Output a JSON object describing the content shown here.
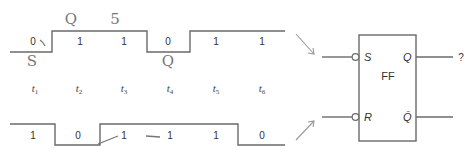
{
  "diagram": {
    "time_labels": [
      {
        "base": "t",
        "sub": "1"
      },
      {
        "base": "t",
        "sub": "2"
      },
      {
        "base": "t",
        "sub": "3"
      },
      {
        "base": "t",
        "sub": "4"
      },
      {
        "base": "t",
        "sub": "5"
      },
      {
        "base": "t",
        "sub": "6"
      }
    ],
    "s_waveform": {
      "name": "S input",
      "values": [
        "0",
        "1",
        "1",
        "0",
        "1",
        "1"
      ]
    },
    "r_waveform": {
      "name": "R input",
      "values": [
        "1",
        "0",
        "1",
        "1",
        "1",
        "0"
      ]
    },
    "handwritten_annotations": [
      "Q",
      "5",
      "S",
      "Q"
    ],
    "flip_flop": {
      "label": "FF",
      "inputs": [
        "S",
        "R"
      ],
      "outputs": [
        "Q",
        "Q̄"
      ],
      "q_output_value": "?"
    }
  }
}
